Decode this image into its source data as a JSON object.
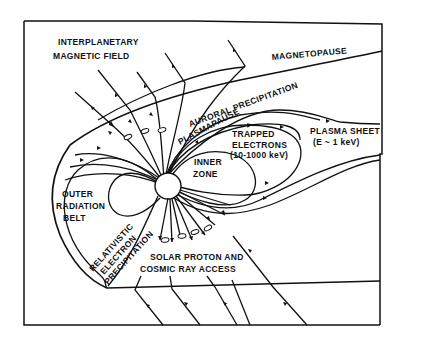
{
  "diagram": {
    "type": "magnetosphere schematic",
    "labels": {
      "imf_line1": "INTERPLANETARY",
      "imf_line2": "MAGNETIC FIELD",
      "magnetopause": "MAGNETOPAUSE",
      "auroral": "AURORAL PRECIPITATION",
      "plasmapause": "PLASMAPAUSE",
      "trapped_line1": "TRAPPED",
      "trapped_line2": "ELECTRONS",
      "trapped_line3": "(10-1000 keV)",
      "plasma_sheet_line1": "PLASMA SHEET",
      "plasma_sheet_line2": "(E ~ 1 keV)",
      "inner_zone_line1": "INNER",
      "inner_zone_line2": "ZONE",
      "outer_belt_line1": "OUTER",
      "outer_belt_line2": "RADIATION",
      "outer_belt_line3": "BELT",
      "relativistic_line1": "RELATIVISTIC",
      "relativistic_line2": "ELECTRON",
      "relativistic_line3": "PRECIPITATION",
      "solar_line1": "SOLAR PROTON AND",
      "solar_line2": "COSMIC RAY ACCESS"
    },
    "colors": {
      "ink": "#111111",
      "background": "#ffffff"
    }
  }
}
